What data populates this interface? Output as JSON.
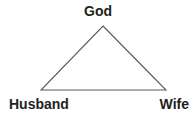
{
  "diagram": {
    "type": "triangle-relationship-diagram",
    "background_color": "#ffffff",
    "line_color": "#58595b",
    "text_color": "#231f20",
    "nodes": [
      {
        "id": "god",
        "label": "God",
        "position": "apex"
      },
      {
        "id": "husband",
        "label": "Husband",
        "position": "bottom-left"
      },
      {
        "id": "wife",
        "label": "Wife",
        "position": "bottom-right"
      }
    ],
    "edges": [
      {
        "from": "god",
        "to": "husband"
      },
      {
        "from": "god",
        "to": "wife"
      },
      {
        "from": "husband",
        "to": "wife"
      }
    ]
  }
}
